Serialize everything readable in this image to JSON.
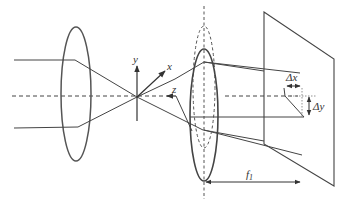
{
  "diagram": {
    "type": "optical-setup",
    "colors": {
      "line": "#444444",
      "lens": "#555555",
      "background": "#ffffff"
    },
    "labels": {
      "y_axis": "y",
      "x_axis": "x",
      "z_axis": "z",
      "delta_x": "Δx",
      "delta_y": "Δy",
      "focal_length": "f",
      "focal_length_subscript": "1"
    },
    "elements": [
      {
        "id": "lens-1",
        "kind": "lens",
        "style": "solid"
      },
      {
        "id": "lens-2",
        "kind": "lens",
        "style": "solid"
      },
      {
        "id": "lens-2-shifted",
        "kind": "lens",
        "style": "dashed"
      },
      {
        "id": "optical-axis",
        "kind": "axis",
        "style": "dashed"
      },
      {
        "id": "image-plane",
        "kind": "screen",
        "style": "solid"
      },
      {
        "id": "coordinate-frame",
        "kind": "axes",
        "axes": [
          "x",
          "y",
          "z"
        ]
      }
    ]
  }
}
